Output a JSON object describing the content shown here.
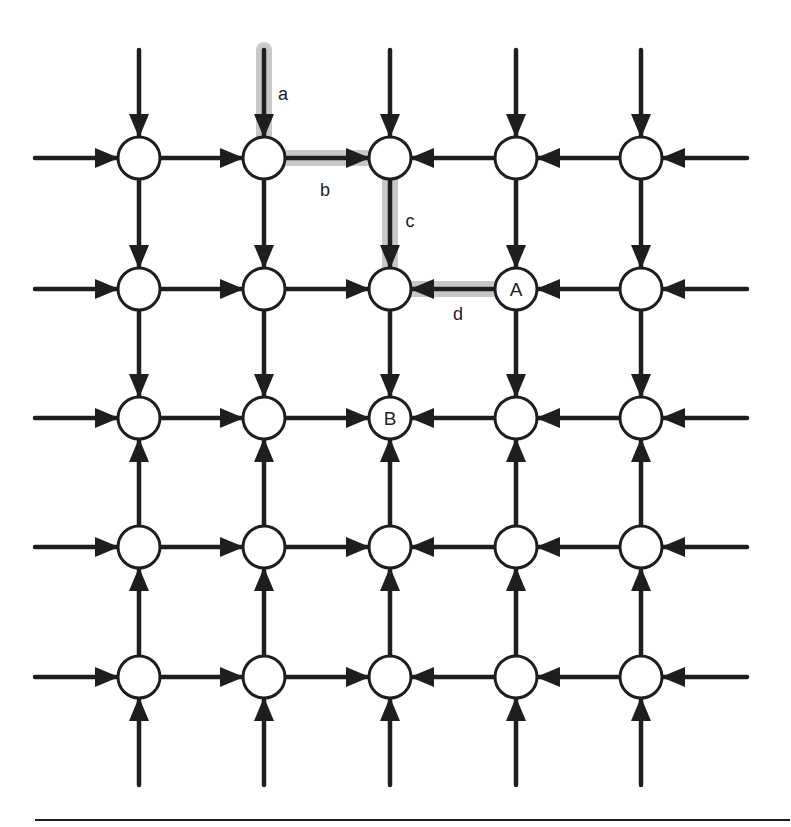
{
  "diagram": {
    "type": "grid-network",
    "rows": 5,
    "cols": 5,
    "col_x": [
      139,
      264,
      390,
      516,
      641
    ],
    "row_y": [
      158,
      289,
      418,
      547,
      677
    ],
    "node_radius": 21,
    "colors": {
      "stroke": "#1e1e1e",
      "highlight": "#c8c8c8",
      "node_fill": "#ffffff",
      "background": "#ffffff"
    },
    "flow_rule": "Horizontal edges point toward column 3 (center); vertical edges point toward row 3 (center). Every node also receives an inbound arrow from outside on the grid boundary.",
    "node_labels": [
      {
        "row": 1,
        "col": 3,
        "text": "A"
      },
      {
        "row": 2,
        "col": 2,
        "text": "B"
      }
    ],
    "highlighted_path": [
      {
        "label": "a",
        "from": "top-external",
        "to": "node(0,1)",
        "desc": "inbound edge from above into row 1, column 2"
      },
      {
        "label": "b",
        "from": "node(0,1)",
        "to": "node(0,2)"
      },
      {
        "label": "c",
        "from": "node(0,2)",
        "to": "node(1,2)"
      },
      {
        "label": "d",
        "from": "node(1,3)",
        "to": "node(1,2)",
        "desc": "from A leftward"
      }
    ],
    "edge_labels": [
      {
        "text": "a",
        "x": 283,
        "y": 100
      },
      {
        "text": "b",
        "x": 325,
        "y": 196
      },
      {
        "text": "c",
        "x": 410,
        "y": 227
      },
      {
        "text": "d",
        "x": 458,
        "y": 320
      }
    ],
    "bottom_rule": {
      "x1": 35,
      "x2": 790,
      "y": 820
    }
  }
}
